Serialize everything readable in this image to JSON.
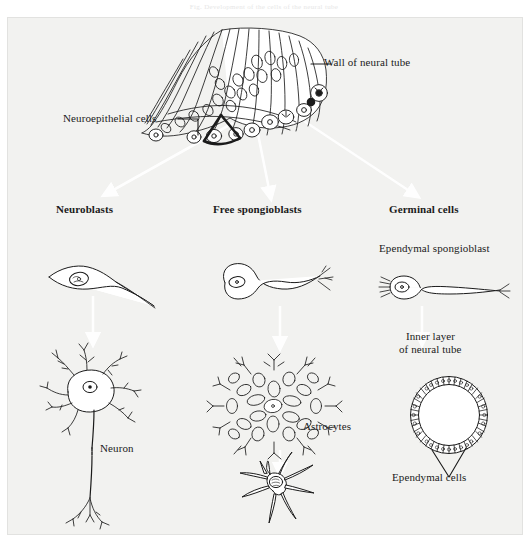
{
  "figure": {
    "top_caption": "Fig. Development of the cells of the neural tube",
    "background_color": "#f2f2f0",
    "ink_color": "#1b1b1b",
    "arrow_color": "#ffffff"
  },
  "labels": {
    "wall_of_neural_tube": "Wall of neural tube",
    "neuroepithelial_cells": "Neuroepithelial cells",
    "neuroblasts": "Neuroblasts",
    "free_spongioblasts": "Free spongioblasts",
    "germinal_cells": "Germinal cells",
    "ependymal_spongioblast": "Ependymal spongioblast",
    "inner_layer_line1": "Inner layer",
    "inner_layer_line2": "of neural tube",
    "neuron": "Neuron",
    "astrocytes": "Astrocytes",
    "ependymal_cells": "Ependymal cells"
  },
  "diagram": {
    "type": "biological-lineage-diagram",
    "source_structure": "neural tube wall",
    "lineages": [
      {
        "name": "Neuroblasts",
        "column": "left",
        "intermediate_cell": "bipolar spindle neuroblast",
        "mature_cell": "Neuron"
      },
      {
        "name": "Free spongioblasts",
        "column": "center",
        "intermediate_cell": "free spongioblast with tapering process",
        "mature_cell": "Astrocytes",
        "mature_forms": [
          "protoplasmic astrocyte",
          "fibrous astrocyte"
        ]
      },
      {
        "name": "Germinal cells",
        "column": "right",
        "intermediate_cell": "Ependymal spongioblast",
        "mature_cell": "Ependymal cells",
        "mature_structure": "Inner layer of neural tube"
      }
    ]
  }
}
